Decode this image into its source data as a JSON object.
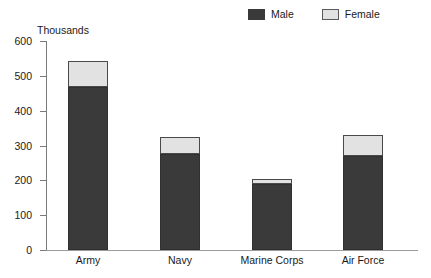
{
  "chart_data": {
    "type": "bar",
    "subtype": "stacked-bar",
    "title": "",
    "subtitle": "",
    "xlabel": "",
    "ylabel": "Thousands",
    "unit_caption": "Thousands",
    "categories": [
      "Army",
      "Navy",
      "Marine Corps",
      "Air Force"
    ],
    "series": [
      {
        "name": "Male",
        "color": "#3a3a3a",
        "values": [
          467,
          275,
          190,
          269
        ]
      },
      {
        "name": "Female",
        "color": "#e2e2e2",
        "values": [
          76,
          50,
          13,
          62
        ]
      }
    ],
    "totals": [
      543,
      325,
      203,
      331
    ],
    "ylim": [
      0,
      600
    ],
    "ytick_step": 100,
    "yticks": [
      600,
      500,
      400,
      300,
      200,
      100,
      0
    ],
    "ytick_labels": [
      "600",
      "500",
      "400",
      "300",
      "200",
      "100",
      "0"
    ],
    "grid": false,
    "legend_position": "top-right",
    "legend": [
      {
        "label": "Male",
        "swatch": "dark-filled-square"
      },
      {
        "label": "Female",
        "swatch": "light-outlined-square"
      }
    ]
  },
  "colors": {
    "male": "#3a3a3a",
    "female": "#e2e2e2",
    "female_border": "#4a4a4a",
    "axis": "#7a7a7a",
    "baseline": "#9a9a9a",
    "text": "#1a1a1a",
    "background": "#ffffff"
  }
}
